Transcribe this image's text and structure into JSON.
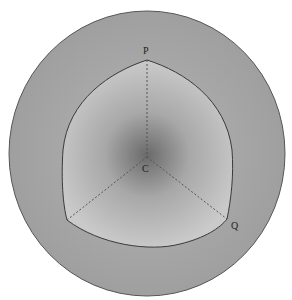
{
  "figure": {
    "labels": {
      "P": "P",
      "C": "C",
      "Q": "Q"
    },
    "colors": {
      "sphere_fill": "#a9a9a9",
      "inner_fill_dark": "#6f6f6f",
      "inner_fill_light": "#c9c9c9",
      "outline": "#444444",
      "dashed": "#555555"
    }
  }
}
